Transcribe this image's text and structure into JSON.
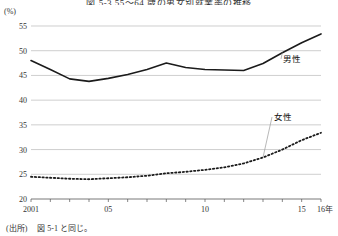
{
  "chart_data": {
    "type": "line",
    "title": "図 5-3  55～64 歳の男女別就業率の推移",
    "unit_label": "(%)",
    "xlabel": "",
    "ylabel": "",
    "x": [
      2001,
      2002,
      2003,
      2004,
      2005,
      2006,
      2007,
      2008,
      2009,
      2010,
      2011,
      2012,
      2013,
      2014,
      2015,
      2016
    ],
    "xtick_labels": [
      "2001",
      "05",
      "10",
      "15",
      "16年"
    ],
    "xtick_values": [
      2001,
      2005,
      2010,
      2015,
      2016
    ],
    "ytick_labels": [
      "20",
      "25",
      "30",
      "35",
      "40",
      "45",
      "50",
      "55"
    ],
    "ylim": [
      20,
      55
    ],
    "xlim": [
      2001,
      2016
    ],
    "grid": true,
    "legend_position": "inline-annotation",
    "series": [
      {
        "name": "男性",
        "style": "solid",
        "values": [
          48.0,
          46.2,
          44.3,
          43.8,
          44.4,
          45.2,
          46.2,
          47.5,
          46.6,
          46.2,
          46.1,
          46.0,
          47.4,
          49.6,
          51.6,
          53.4
        ]
      },
      {
        "name": "女性",
        "style": "dotted",
        "values": [
          24.5,
          24.3,
          24.1,
          24.0,
          24.2,
          24.4,
          24.7,
          25.2,
          25.5,
          25.9,
          26.4,
          27.2,
          28.4,
          30.0,
          31.9,
          33.4
        ]
      }
    ],
    "annotations": [
      {
        "label": "男性",
        "target_year": 2014,
        "target_value": 49.6
      },
      {
        "label": "女性",
        "target_year": 2013,
        "target_value": 28.4
      }
    ]
  },
  "source": {
    "prefix": "(出所)",
    "text": "図 5-1 と同じ。"
  }
}
